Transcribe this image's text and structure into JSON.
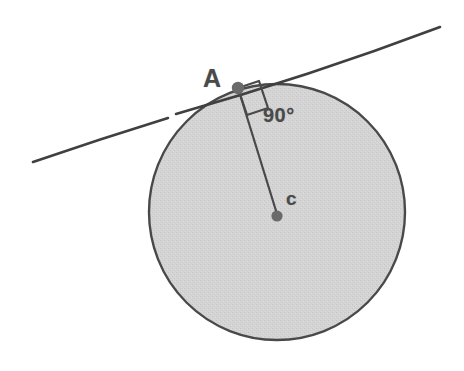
{
  "figure": {
    "background_color": "#ffffff",
    "width": 464,
    "height": 371
  },
  "colors": {
    "circle_fill": "#d2d2d2",
    "circle_stroke": "#4a4a4a",
    "line_stroke": "#3f3f3f",
    "label_text": "#4a4a4a",
    "point_marker": "#6a6a6a",
    "background": "#ffffff"
  },
  "labels": {
    "tangent_point": "A",
    "right_angle": "90°",
    "center_point": "c"
  },
  "geometry": {
    "circle": {
      "center_x": 277,
      "center_y": 212,
      "radius": 128
    },
    "tangent_point": {
      "x": 238,
      "y": 88
    },
    "center_point": {
      "x": 277,
      "y": 216
    },
    "tangent_line": {
      "x1": 33,
      "y1": 162,
      "x2": 440,
      "y2": 27
    },
    "radius_line": {
      "x1": 238,
      "y1": 88,
      "x2": 277,
      "y2": 214
    },
    "right_angle_marker_size": 22
  }
}
